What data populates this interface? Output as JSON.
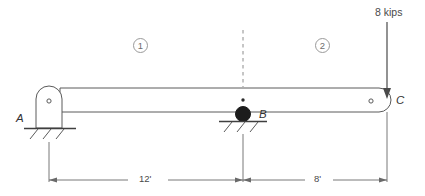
{
  "diagram": {
    "type": "structural-beam-free-body-diagram",
    "stroke_color": "#5a5a5a",
    "text_color": "#3a3a3a",
    "roller_color": "#1c1c1c",
    "background_color": "#ffffff"
  },
  "supports": [
    {
      "id": "A",
      "label": "A",
      "kind": "pin-support",
      "x_ft": 0
    },
    {
      "id": "B",
      "label": "B",
      "kind": "roller-support",
      "x_ft": 12
    }
  ],
  "points": [
    {
      "id": "C",
      "label": "C",
      "kind": "beam-free-end",
      "x_ft": 20
    }
  ],
  "load": {
    "label": "8 kips",
    "magnitude": 8,
    "unit": "kips",
    "direction": "down",
    "applied_at": "C"
  },
  "segments": [
    {
      "label": "1",
      "from": "A",
      "to": "B"
    },
    {
      "label": "2",
      "from": "B",
      "to": "C"
    }
  ],
  "dimensions": [
    {
      "label": "12'",
      "value": 12,
      "unit": "ft",
      "from": "A",
      "to": "B"
    },
    {
      "label": "8'",
      "value": 8,
      "unit": "ft",
      "from": "B",
      "to": "C"
    }
  ],
  "annotations": {
    "section_cut_line": "dashed-vertical-section-line",
    "centroid_marker": "beam-centroid-dot"
  }
}
